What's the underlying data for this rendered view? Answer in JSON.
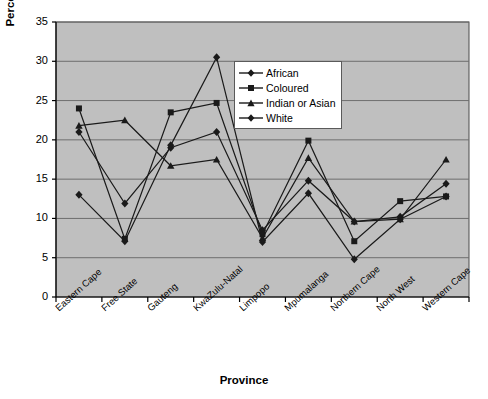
{
  "chart_data": {
    "type": "line",
    "title": "",
    "xlabel": "Province",
    "ylabel": "Percent employment",
    "ylim": [
      0,
      35
    ],
    "ytick_step": 5,
    "yticks": [
      "0",
      "5",
      "10",
      "15",
      "20",
      "25",
      "30",
      "35"
    ],
    "grid": true,
    "grid_axis": "y",
    "plot_background": "#bfbfbf",
    "line_color": "#1a1a1a",
    "legend_position": "upper-center-right",
    "categories": [
      "Eastern Cape",
      "Free State",
      "Gauteng",
      "KwaZulu-Natal",
      "Limpopo",
      "Mpumalanga",
      "Northern Cape",
      "North West",
      "Western Cape"
    ],
    "series": [
      {
        "name": "African",
        "marker": "diamond",
        "values": [
          21.0,
          11.9,
          19.0,
          21.0,
          8.5,
          14.8,
          9.6,
          10.2,
          14.4
        ]
      },
      {
        "name": "Coloured",
        "marker": "square",
        "values": [
          24.0,
          7.4,
          23.5,
          24.7,
          8.0,
          19.9,
          7.1,
          12.2,
          12.8
        ]
      },
      {
        "name": "Indian or Asian",
        "marker": "triangle",
        "values": [
          21.8,
          22.5,
          16.7,
          17.5,
          7.5,
          17.7,
          9.6,
          9.9,
          17.5
        ]
      },
      {
        "name": "White",
        "marker": "diamond",
        "values": [
          13.0,
          7.1,
          19.3,
          30.5,
          7.0,
          13.2,
          4.8,
          9.9,
          12.8
        ]
      }
    ]
  },
  "legend": {
    "items": [
      {
        "label": "African"
      },
      {
        "label": "Coloured"
      },
      {
        "label": "Indian or Asian"
      },
      {
        "label": "White"
      }
    ]
  }
}
